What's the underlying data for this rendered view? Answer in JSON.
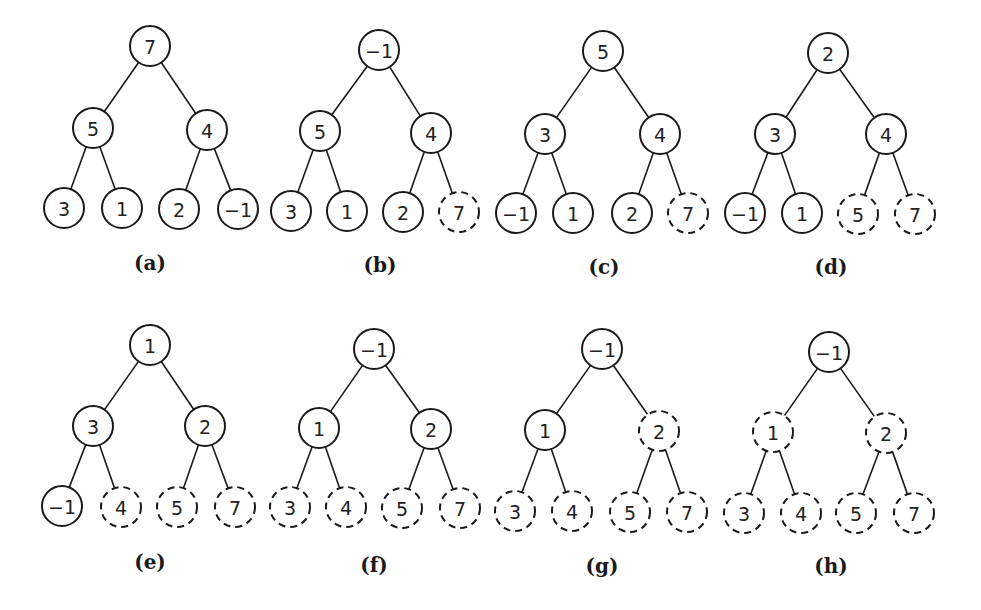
{
  "figure": {
    "node_radius": 20,
    "colors": {
      "stroke": "#1a1a1a",
      "text": "#222222",
      "background": "#ffffff"
    },
    "edges_template": [
      [
        0,
        1
      ],
      [
        0,
        2
      ],
      [
        1,
        3
      ],
      [
        1,
        4
      ],
      [
        2,
        5
      ],
      [
        2,
        6
      ]
    ],
    "panels": [
      {
        "label": "(a)",
        "label_pos": [
          150,
          263
        ],
        "nodes": [
          {
            "value": "7",
            "x": 150,
            "y": 46,
            "dashed": false
          },
          {
            "value": "5",
            "x": 93,
            "y": 128,
            "dashed": false
          },
          {
            "value": "4",
            "x": 207,
            "y": 130,
            "dashed": false
          },
          {
            "value": "3",
            "x": 64,
            "y": 208,
            "dashed": false
          },
          {
            "value": "1",
            "x": 122,
            "y": 208,
            "dashed": false
          },
          {
            "value": "2",
            "x": 179,
            "y": 209,
            "dashed": false
          },
          {
            "value": "−1",
            "x": 238,
            "y": 209,
            "dashed": false
          }
        ]
      },
      {
        "label": "(b)",
        "label_pos": [
          380,
          265
        ],
        "nodes": [
          {
            "value": "−1",
            "x": 379,
            "y": 50,
            "dashed": false
          },
          {
            "value": "5",
            "x": 320,
            "y": 131,
            "dashed": false
          },
          {
            "value": "4",
            "x": 431,
            "y": 133,
            "dashed": false
          },
          {
            "value": "3",
            "x": 291,
            "y": 211,
            "dashed": false
          },
          {
            "value": "1",
            "x": 347,
            "y": 211,
            "dashed": false
          },
          {
            "value": "2",
            "x": 403,
            "y": 212,
            "dashed": false
          },
          {
            "value": "7",
            "x": 459,
            "y": 212,
            "dashed": true
          }
        ]
      },
      {
        "label": "(c)",
        "label_pos": [
          604,
          267
        ],
        "nodes": [
          {
            "value": "5",
            "x": 603,
            "y": 51,
            "dashed": false
          },
          {
            "value": "3",
            "x": 545,
            "y": 134,
            "dashed": false
          },
          {
            "value": "4",
            "x": 660,
            "y": 134,
            "dashed": false
          },
          {
            "value": "−1",
            "x": 516,
            "y": 213,
            "dashed": false
          },
          {
            "value": "1",
            "x": 573,
            "y": 213,
            "dashed": false
          },
          {
            "value": "2",
            "x": 632,
            "y": 213,
            "dashed": false
          },
          {
            "value": "7",
            "x": 688,
            "y": 213,
            "dashed": true
          }
        ]
      },
      {
        "label": "(d)",
        "label_pos": [
          831,
          267
        ],
        "nodes": [
          {
            "value": "2",
            "x": 828,
            "y": 53,
            "dashed": false
          },
          {
            "value": "3",
            "x": 775,
            "y": 134,
            "dashed": false
          },
          {
            "value": "4",
            "x": 886,
            "y": 134,
            "dashed": false
          },
          {
            "value": "−1",
            "x": 745,
            "y": 213,
            "dashed": false
          },
          {
            "value": "1",
            "x": 802,
            "y": 213,
            "dashed": false
          },
          {
            "value": "5",
            "x": 858,
            "y": 214,
            "dashed": true
          },
          {
            "value": "7",
            "x": 915,
            "y": 214,
            "dashed": true
          }
        ]
      },
      {
        "label": "(e)",
        "label_pos": [
          150,
          562
        ],
        "nodes": [
          {
            "value": "1",
            "x": 150,
            "y": 345,
            "dashed": false
          },
          {
            "value": "3",
            "x": 93,
            "y": 426,
            "dashed": false
          },
          {
            "value": "2",
            "x": 205,
            "y": 426,
            "dashed": false
          },
          {
            "value": "−1",
            "x": 62,
            "y": 506,
            "dashed": false
          },
          {
            "value": "4",
            "x": 121,
            "y": 507,
            "dashed": true
          },
          {
            "value": "5",
            "x": 177,
            "y": 507,
            "dashed": true
          },
          {
            "value": "7",
            "x": 235,
            "y": 507,
            "dashed": true
          }
        ]
      },
      {
        "label": "(f)",
        "label_pos": [
          374,
          565
        ],
        "nodes": [
          {
            "value": "−1",
            "x": 374,
            "y": 349,
            "dashed": false
          },
          {
            "value": "1",
            "x": 319,
            "y": 428,
            "dashed": false
          },
          {
            "value": "2",
            "x": 431,
            "y": 429,
            "dashed": false
          },
          {
            "value": "3",
            "x": 290,
            "y": 507,
            "dashed": true
          },
          {
            "value": "4",
            "x": 346,
            "y": 507,
            "dashed": true
          },
          {
            "value": "5",
            "x": 402,
            "y": 508,
            "dashed": true
          },
          {
            "value": "7",
            "x": 460,
            "y": 508,
            "dashed": true
          }
        ]
      },
      {
        "label": "(g)",
        "label_pos": [
          602,
          566
        ],
        "nodes": [
          {
            "value": "−1",
            "x": 602,
            "y": 349,
            "dashed": false
          },
          {
            "value": "1",
            "x": 545,
            "y": 430,
            "dashed": false
          },
          {
            "value": "2",
            "x": 659,
            "y": 431,
            "dashed": true
          },
          {
            "value": "3",
            "x": 515,
            "y": 511,
            "dashed": true
          },
          {
            "value": "4",
            "x": 572,
            "y": 511,
            "dashed": true
          },
          {
            "value": "5",
            "x": 630,
            "y": 512,
            "dashed": true
          },
          {
            "value": "7",
            "x": 687,
            "y": 512,
            "dashed": true
          }
        ]
      },
      {
        "label": "(h)",
        "label_pos": [
          831,
          566
        ],
        "nodes": [
          {
            "value": "−1",
            "x": 829,
            "y": 352,
            "dashed": false
          },
          {
            "value": "1",
            "x": 773,
            "y": 432,
            "dashed": true
          },
          {
            "value": "2",
            "x": 886,
            "y": 433,
            "dashed": true
          },
          {
            "value": "3",
            "x": 744,
            "y": 513,
            "dashed": true
          },
          {
            "value": "4",
            "x": 801,
            "y": 513,
            "dashed": true
          },
          {
            "value": "5",
            "x": 856,
            "y": 513,
            "dashed": true
          },
          {
            "value": "7",
            "x": 914,
            "y": 513,
            "dashed": true
          }
        ]
      }
    ]
  }
}
